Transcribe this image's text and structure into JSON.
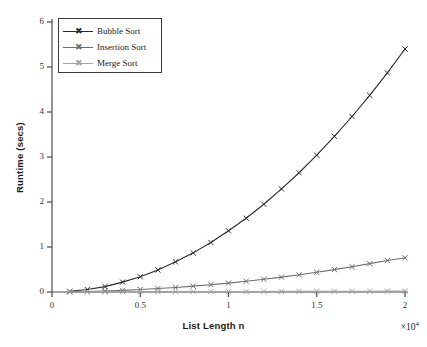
{
  "chart_data": {
    "type": "line",
    "title": "",
    "xlabel": "List Length n",
    "ylabel": "Runtime (secs)",
    "x_multiplier": "×10",
    "x_multiplier_exp": "4",
    "xlim": [
      0,
      20000
    ],
    "ylim": [
      0,
      6
    ],
    "xticks": [
      0,
      5000,
      10000,
      15000,
      20000
    ],
    "xtick_labels": [
      "0",
      "0.5",
      "1",
      "1.5",
      "2"
    ],
    "yticks": [
      0,
      1,
      2,
      3,
      4,
      5,
      6
    ],
    "ytick_labels": [
      "0",
      "1",
      "2",
      "3",
      "4",
      "5",
      "6"
    ],
    "grid": false,
    "legend_position": "upper left",
    "x": [
      1000,
      2000,
      3000,
      4000,
      5000,
      6000,
      7000,
      8000,
      9000,
      10000,
      11000,
      12000,
      13000,
      14000,
      15000,
      16000,
      17000,
      18000,
      19000,
      20000
    ],
    "series": [
      {
        "name": "Bubble Sort",
        "color": "#2b2b2b",
        "marker": "x",
        "values": [
          0.015,
          0.055,
          0.12,
          0.22,
          0.34,
          0.49,
          0.67,
          0.87,
          1.1,
          1.36,
          1.64,
          1.95,
          2.29,
          2.65,
          3.04,
          3.46,
          3.9,
          4.37,
          4.87,
          5.4
        ]
      },
      {
        "name": "Insertion Sort",
        "color": "#6e6e6e",
        "marker": "x",
        "values": [
          0.004,
          0.012,
          0.023,
          0.036,
          0.055,
          0.077,
          0.101,
          0.13,
          0.162,
          0.198,
          0.238,
          0.282,
          0.33,
          0.382,
          0.438,
          0.498,
          0.562,
          0.63,
          0.701,
          0.76
        ]
      },
      {
        "name": "Merge Sort",
        "color": "#a3a3a3",
        "marker": "x",
        "values": [
          0.001,
          0.002,
          0.003,
          0.004,
          0.005,
          0.006,
          0.007,
          0.008,
          0.009,
          0.01,
          0.011,
          0.012,
          0.013,
          0.014,
          0.015,
          0.016,
          0.017,
          0.018,
          0.019,
          0.02
        ]
      }
    ]
  },
  "legend": {
    "items": [
      {
        "label": "Bubble Sort"
      },
      {
        "label": "Insertion Sort"
      },
      {
        "label": "Merge Sort"
      }
    ]
  },
  "axes": {
    "x_title": "List Length n",
    "y_title": "Runtime (secs)"
  }
}
